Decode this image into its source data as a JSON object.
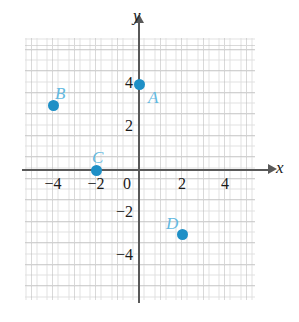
{
  "figure": {
    "type": "coordinate-plane",
    "axis_labels": {
      "x": "x",
      "y": "y"
    },
    "x_ticks": [
      {
        "value": -4,
        "label": "−4"
      },
      {
        "value": -2,
        "label": "−2"
      },
      {
        "value": 0,
        "label": "0"
      },
      {
        "value": 2,
        "label": "2"
      },
      {
        "value": 4,
        "label": "4"
      }
    ],
    "y_ticks": [
      {
        "value": 4,
        "label": "4"
      },
      {
        "value": 2,
        "label": "2"
      },
      {
        "value": -2,
        "label": "−2"
      },
      {
        "value": -4,
        "label": "−4"
      }
    ],
    "points": [
      {
        "label": "A",
        "x": 0,
        "y": 4
      },
      {
        "label": "B",
        "x": -4,
        "y": 3
      },
      {
        "label": "C",
        "x": -2,
        "y": 0
      },
      {
        "label": "D",
        "x": 2,
        "y": -3
      }
    ],
    "colors": {
      "point": "#1e8fc6",
      "point_label": "#63b9e0",
      "axis": "#595959",
      "grid": "#c9c9c9",
      "tick_text": "#1a1a1a"
    }
  },
  "chart_data": {
    "type": "scatter",
    "title": "",
    "xlabel": "x",
    "ylabel": "y",
    "xlim": [
      -5.3,
      5.4
    ],
    "ylim": [
      -6.1,
      6.1
    ],
    "grid": true,
    "legend": "none",
    "x_tick_labels": [
      "−4",
      "−2",
      "0",
      "2",
      "4"
    ],
    "y_tick_labels": [
      "4",
      "2",
      "−2",
      "−4"
    ],
    "series": [
      {
        "name": "points",
        "point_labels": [
          "A",
          "B",
          "C",
          "D"
        ],
        "x": [
          0,
          -4,
          -2,
          2
        ],
        "y": [
          4,
          3,
          0,
          -3
        ]
      }
    ]
  }
}
